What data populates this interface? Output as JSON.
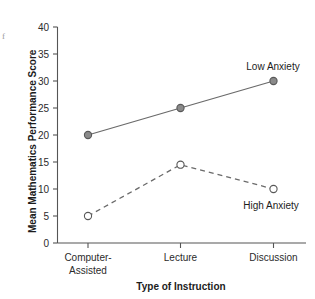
{
  "corner_mark": "f",
  "chart_data": {
    "type": "line",
    "title": "",
    "xlabel": "Type of Instruction",
    "ylabel": "Mean Mathematics Performance Score",
    "categories": [
      "Computer-Assisted",
      "Lecture",
      "Discussion"
    ],
    "category_lines": [
      [
        "Computer-",
        "Assisted"
      ],
      [
        "Lecture"
      ],
      [
        "Discussion"
      ]
    ],
    "x": [
      0,
      1,
      2
    ],
    "ylim": [
      0,
      40
    ],
    "yticks": [
      0,
      5,
      10,
      15,
      20,
      25,
      30,
      35,
      40
    ],
    "ytick_labels": [
      "0",
      "5",
      "10",
      "15",
      "20",
      "25",
      "30",
      "35",
      "40"
    ],
    "grid": false,
    "legend_position": "inline-annotations",
    "series": [
      {
        "name": "Low Anxiety",
        "values": [
          20,
          25,
          30
        ],
        "line_style": "solid",
        "marker": "filled-circle",
        "color": "#6a6a6a"
      },
      {
        "name": "High Anxiety",
        "values": [
          5,
          14.5,
          10
        ],
        "line_style": "dashed",
        "marker": "open-circle",
        "color": "#6a6a6a"
      }
    ],
    "annotations": [
      {
        "text": "Low Anxiety",
        "series": "Low Anxiety"
      },
      {
        "text": "High Anxiety",
        "series": "High Anxiety"
      }
    ]
  }
}
